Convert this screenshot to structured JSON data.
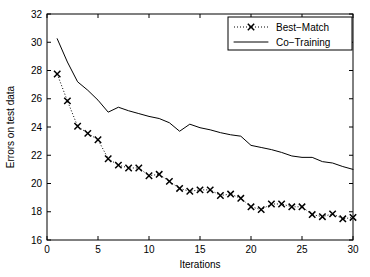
{
  "chart_data": {
    "type": "line",
    "title": "",
    "xlabel": "Iterations",
    "ylabel": "Errors on test data",
    "xlim": [
      0,
      30
    ],
    "ylim": [
      16,
      32
    ],
    "xticks": [
      0,
      5,
      10,
      15,
      20,
      25,
      30
    ],
    "yticks": [
      16,
      18,
      20,
      22,
      24,
      26,
      28,
      30,
      32
    ],
    "grid": false,
    "legend_position": "top-right",
    "x": [
      1,
      2,
      3,
      4,
      5,
      6,
      7,
      8,
      9,
      10,
      11,
      12,
      13,
      14,
      15,
      16,
      17,
      18,
      19,
      20,
      21,
      22,
      23,
      24,
      25,
      26,
      27,
      28,
      29,
      30
    ],
    "series": [
      {
        "name": "Best-Match",
        "style": "dotted",
        "marker": "x",
        "color": "#000000",
        "values": [
          27.75,
          25.85,
          24.05,
          23.55,
          23.1,
          21.75,
          21.3,
          21.1,
          21.1,
          20.55,
          20.65,
          20.15,
          19.65,
          19.45,
          19.55,
          19.55,
          19.15,
          19.25,
          18.95,
          18.35,
          18.15,
          18.55,
          18.55,
          18.35,
          18.35,
          17.8,
          17.65,
          17.85,
          17.5,
          17.6
        ]
      },
      {
        "name": "Co-Training",
        "style": "solid",
        "marker": "none",
        "color": "#000000",
        "values": [
          30.25,
          28.6,
          27.2,
          26.6,
          25.9,
          25.05,
          25.4,
          25.15,
          24.95,
          24.75,
          24.6,
          24.3,
          23.7,
          24.2,
          23.95,
          23.8,
          23.6,
          23.45,
          23.35,
          22.7,
          22.55,
          22.4,
          22.2,
          21.95,
          21.85,
          21.85,
          21.55,
          21.45,
          21.2,
          21.0
        ]
      }
    ]
  },
  "legend": {
    "entries": [
      {
        "label": "Best−Match",
        "style": "dotted",
        "marker": "x"
      },
      {
        "label": "Co−Training",
        "style": "solid",
        "marker": "none"
      }
    ]
  },
  "axes": {
    "x_title": "Iterations",
    "y_title": "Errors on test data",
    "x_tick_labels": [
      "0",
      "5",
      "10",
      "15",
      "20",
      "25",
      "30"
    ],
    "y_tick_labels": [
      "16",
      "18",
      "20",
      "22",
      "24",
      "26",
      "28",
      "30",
      "32"
    ]
  }
}
